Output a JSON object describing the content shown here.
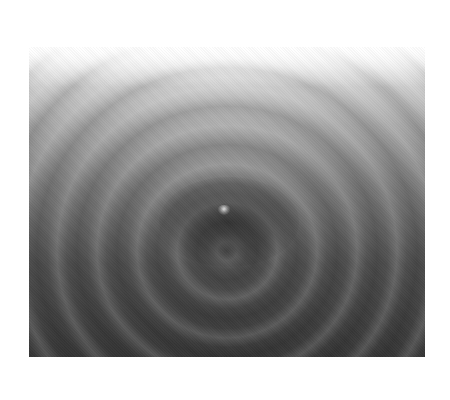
{
  "image": {
    "subject": "water ripples radiating from a droplet impact",
    "palette": {
      "background": "#ffffff",
      "top_tone": "#d8d8d8",
      "mid_tone": "#7a7a7a",
      "bottom_tone": "#383838"
    }
  }
}
